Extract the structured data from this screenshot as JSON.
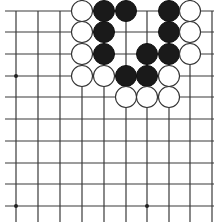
{
  "board": {
    "colors": {
      "background": "#ffffff",
      "line": "#3a3a3a",
      "black": "#1a1a1a",
      "white": "#ffffff"
    },
    "grid": {
      "columns_x": [
        16,
        38,
        60,
        82,
        104,
        126,
        147,
        169,
        190,
        212
      ],
      "rows_y": [
        11,
        32,
        54,
        76,
        97,
        119,
        141,
        163,
        184,
        206
      ],
      "top_edge": true,
      "left_edge": false,
      "right_edge": false,
      "bottom_edge": false
    },
    "star_points": [
      {
        "col": 0,
        "row": 3
      },
      {
        "col": 0,
        "row": 9
      },
      {
        "col": 6,
        "row": 9
      }
    ],
    "stones": [
      {
        "color": "white",
        "col": 3,
        "row": 0
      },
      {
        "color": "black",
        "col": 4,
        "row": 0
      },
      {
        "color": "black",
        "col": 5,
        "row": 0
      },
      {
        "color": "black",
        "col": 7,
        "row": 0
      },
      {
        "color": "white",
        "col": 8,
        "row": 0
      },
      {
        "color": "white",
        "col": 3,
        "row": 1
      },
      {
        "color": "black",
        "col": 4,
        "row": 1
      },
      {
        "color": "black",
        "col": 7,
        "row": 1
      },
      {
        "color": "white",
        "col": 8,
        "row": 1
      },
      {
        "color": "white",
        "col": 3,
        "row": 2
      },
      {
        "color": "black",
        "col": 4,
        "row": 2
      },
      {
        "color": "black",
        "col": 6,
        "row": 2
      },
      {
        "color": "black",
        "col": 7,
        "row": 2
      },
      {
        "color": "white",
        "col": 8,
        "row": 2
      },
      {
        "color": "white",
        "col": 3,
        "row": 3
      },
      {
        "color": "white",
        "col": 4,
        "row": 3
      },
      {
        "color": "black",
        "col": 5,
        "row": 3
      },
      {
        "color": "black",
        "col": 6,
        "row": 3
      },
      {
        "color": "white",
        "col": 7,
        "row": 3
      },
      {
        "color": "white",
        "col": 5,
        "row": 4
      },
      {
        "color": "white",
        "col": 6,
        "row": 4
      },
      {
        "color": "white",
        "col": 7,
        "row": 4
      }
    ],
    "stone_radius": 10.5
  }
}
